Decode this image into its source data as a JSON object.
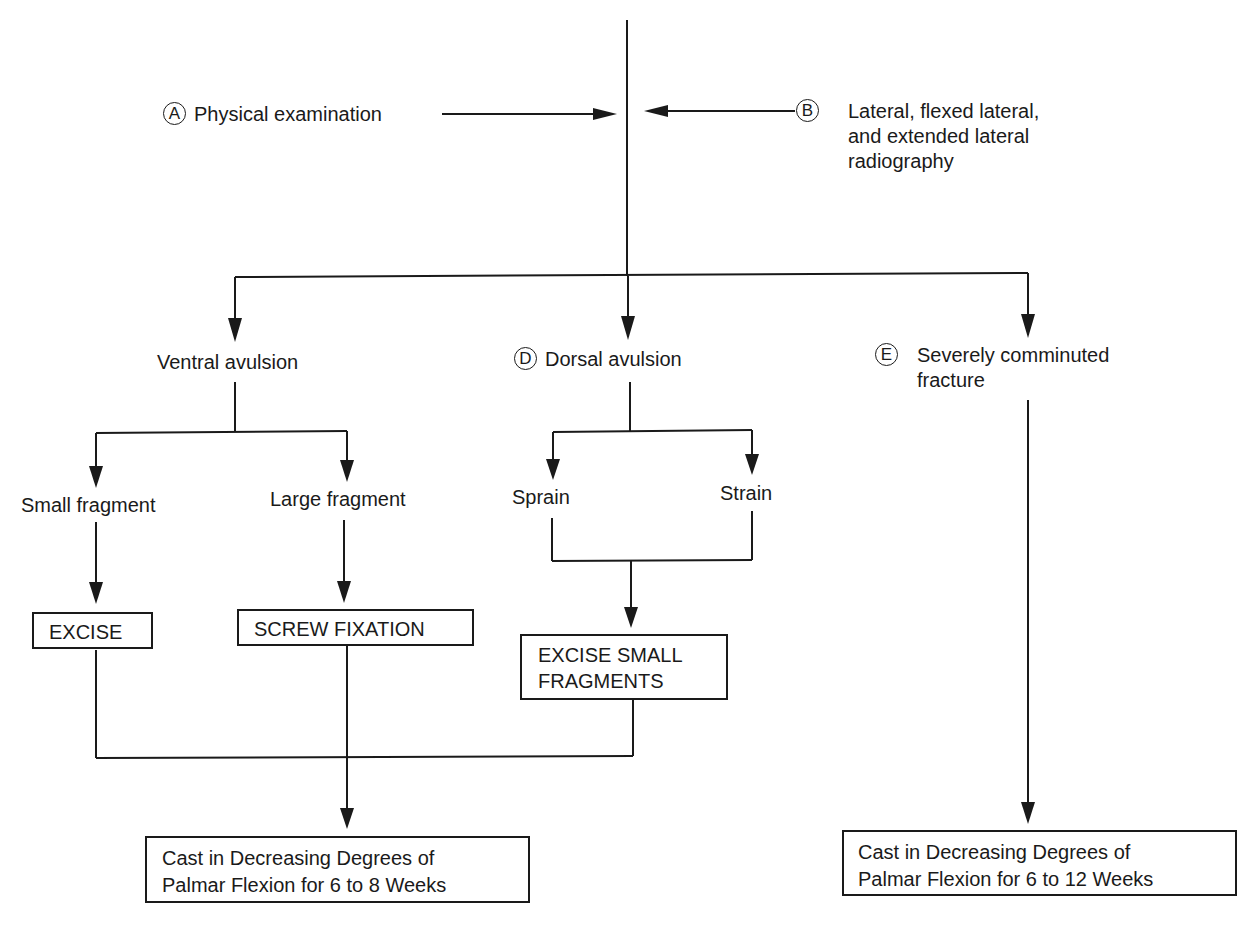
{
  "diagram": {
    "type": "clinical decision flowchart",
    "inputs": {
      "a": {
        "marker": "A",
        "label": "Physical examination"
      },
      "b": {
        "marker": "B",
        "lines": [
          "Lateral, flexed lateral,",
          "and extended lateral",
          "radiography"
        ]
      }
    },
    "branches": {
      "ventral": {
        "label": "Ventral avulsion",
        "small": {
          "label": "Small fragment",
          "action": "EXCISE"
        },
        "large": {
          "label": "Large fragment",
          "action": "SCREW FIXATION"
        }
      },
      "dorsal": {
        "marker": "D",
        "label": "Dorsal avulsion",
        "sprain": "Sprain",
        "strain": "Strain",
        "action_lines": [
          "EXCISE SMALL",
          "FRAGMENTS"
        ]
      },
      "comminuted": {
        "marker": "E",
        "lines": [
          "Severely comminuted",
          "fracture"
        ]
      }
    },
    "outcomes": {
      "left": {
        "lines": [
          "Cast in Decreasing Degrees of",
          "Palmar Flexion for 6 to 8 Weeks"
        ]
      },
      "right": {
        "lines": [
          "Cast in Decreasing Degrees of",
          "Palmar Flexion for 6 to 12 Weeks"
        ]
      }
    },
    "colors": {
      "ink": "#1a1a1a",
      "background": "#ffffff"
    }
  }
}
